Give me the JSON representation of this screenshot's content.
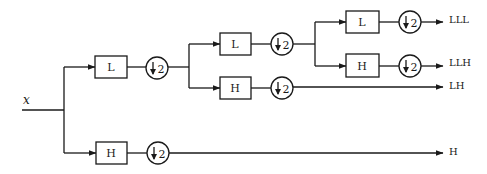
{
  "diagram": {
    "type": "wavelet-packet-filter-bank",
    "input_label": "x",
    "downsample_label": "2",
    "downsample_symbol": "down-arrow",
    "filters": [
      {
        "id": "L1",
        "label": "L",
        "level": 1
      },
      {
        "id": "H1",
        "label": "H",
        "level": 1
      },
      {
        "id": "L2",
        "label": "L",
        "level": 2
      },
      {
        "id": "H2",
        "label": "H",
        "level": 2
      },
      {
        "id": "L3",
        "label": "L",
        "level": 3
      },
      {
        "id": "H3",
        "label": "H",
        "level": 3
      }
    ],
    "downsamplers": [
      {
        "id": "D1",
        "after": "L1",
        "label": "2"
      },
      {
        "id": "D2",
        "after": "H1",
        "label": "2"
      },
      {
        "id": "D3",
        "after": "L2",
        "label": "2"
      },
      {
        "id": "D4",
        "after": "H2",
        "label": "2"
      },
      {
        "id": "D5",
        "after": "L3",
        "label": "2"
      },
      {
        "id": "D6",
        "after": "H3",
        "label": "2"
      }
    ],
    "outputs": [
      {
        "id": "LLL",
        "label": "LLL"
      },
      {
        "id": "LLH",
        "label": "LLH"
      },
      {
        "id": "LH",
        "label": "LH"
      },
      {
        "id": "H",
        "label": "H"
      }
    ]
  }
}
